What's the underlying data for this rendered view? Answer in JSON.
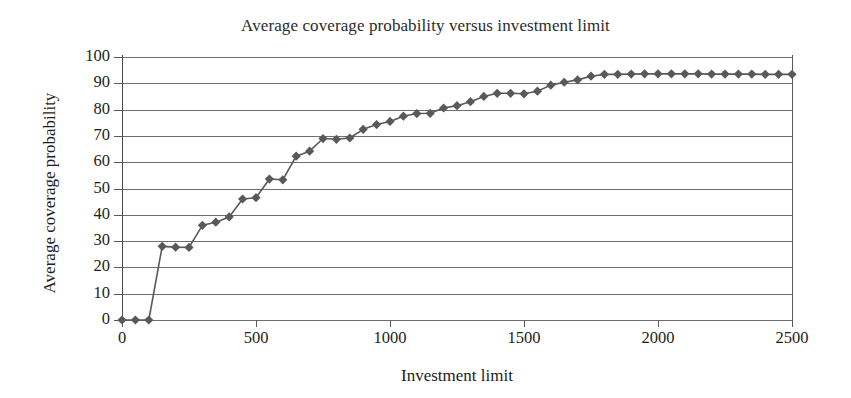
{
  "chart_data": {
    "type": "line",
    "title": "Average coverage probability versus investment limit",
    "xlabel": "Investment limit",
    "ylabel": "Average coverage probability",
    "xlim": [
      0,
      2500
    ],
    "ylim": [
      0,
      100
    ],
    "xticks": [
      0,
      500,
      1000,
      1500,
      2000,
      2500
    ],
    "yticks": [
      0,
      10,
      20,
      30,
      40,
      50,
      60,
      70,
      80,
      90,
      100
    ],
    "grid": "horizontal",
    "legend": "none",
    "marker": "diamond",
    "marker_color": "#595959",
    "line_color": "#595959",
    "series": [
      {
        "name": "Average coverage probability",
        "x": [
          0,
          50,
          100,
          150,
          200,
          250,
          300,
          350,
          400,
          450,
          500,
          550,
          600,
          650,
          700,
          750,
          800,
          850,
          900,
          950,
          1000,
          1050,
          1100,
          1150,
          1200,
          1250,
          1300,
          1350,
          1400,
          1450,
          1500,
          1550,
          1600,
          1650,
          1700,
          1750,
          1800,
          1850,
          1900,
          1950,
          2000,
          2050,
          2100,
          2150,
          2200,
          2250,
          2300,
          2350,
          2400,
          2450,
          2500
        ],
        "values": [
          0,
          0,
          0,
          28,
          27.7,
          27.6,
          36,
          37.2,
          39.2,
          46,
          46.5,
          53.6,
          53.3,
          62.3,
          64.2,
          69,
          68.7,
          69.2,
          72.5,
          74.3,
          75.5,
          77.5,
          78.5,
          78.6,
          80.6,
          81.5,
          83,
          85,
          86.2,
          86.2,
          86,
          87,
          89.3,
          90.4,
          91.3,
          92.7,
          93.4,
          93.4,
          93.5,
          93.6,
          93.6,
          93.6,
          93.6,
          93.6,
          93.5,
          93.5,
          93.5,
          93.5,
          93.4,
          93.4,
          93.4
        ]
      }
    ]
  },
  "axis": {
    "y_tick_labels": [
      "100",
      "90",
      "80",
      "70",
      "60",
      "50",
      "40",
      "30",
      "20",
      "10",
      "0"
    ],
    "x_tick_labels": [
      "0",
      "500",
      "1000",
      "1500",
      "2000",
      "2500"
    ]
  }
}
